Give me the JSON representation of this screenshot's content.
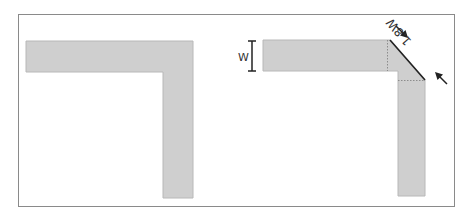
{
  "colors": {
    "frame": "#8a8a8a",
    "fill": "#cfcfcf",
    "fill_edge": "#b8b8b8",
    "ink": "#222222",
    "dotted": "#8c8c8c"
  },
  "panels": [
    {
      "id": "left",
      "description": "Plain right-angle trace bend (L-shape, square corner)"
    },
    {
      "id": "right",
      "description": "Mitered right-angle trace bend with 45 degree chamfer",
      "width_label": "W",
      "chamfer_label": "1.8W"
    }
  ]
}
